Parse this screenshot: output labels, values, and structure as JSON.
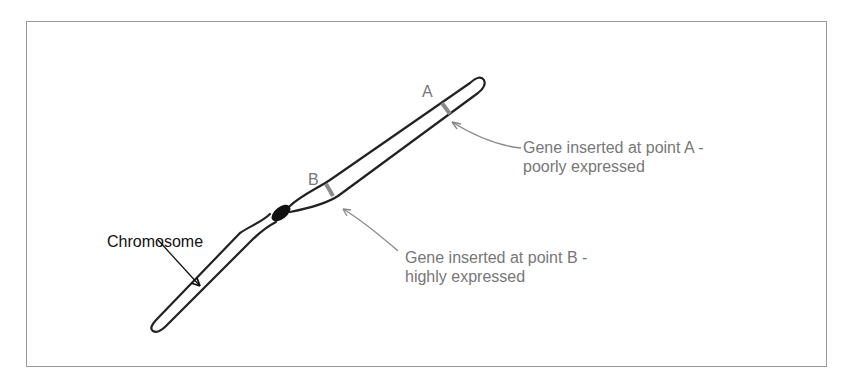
{
  "figure": {
    "chromosome_label": "Chromosome",
    "point_a_label": "A",
    "point_b_label": "B",
    "annotation_a": {
      "line1": "Gene inserted at point A -",
      "line2": "poorly expressed"
    },
    "annotation_b": {
      "line1": "Gene inserted at point B -",
      "line2": "highly expressed"
    },
    "colors": {
      "outline": "#222222",
      "annotation_text": "#777777",
      "annotation_arrow": "#888888",
      "gene_band": "#8a8a8a",
      "frame_border": "#9a9a9a"
    }
  }
}
